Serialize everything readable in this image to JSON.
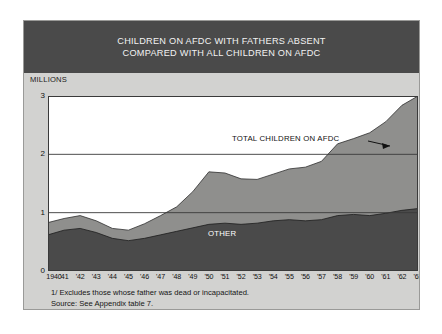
{
  "figure": {
    "title_lines": [
      "CHILDREN ON AFDC WITH FATHERS ABSENT",
      "COMPARED WITH ALL CHILDREN ON AFDC"
    ],
    "units_label": "MILLIONS",
    "footnotes": [
      "1/ Excludes those whose father was dead or incapacitated.",
      "Source: See Appendix table 7."
    ],
    "colors": {
      "title_band": "#4a4a4a",
      "panel": "#d2d2d0",
      "plot_background": "#ffffff",
      "band_total": "#8f8f8d",
      "band_other": "#4a4a4a",
      "gridline": "#3a3a3a"
    }
  },
  "chart_data": {
    "type": "area",
    "title": "CHILDREN ON AFDC WITH FATHERS ABSENT COMPARED WITH ALL CHILDREN ON AFDC",
    "xlabel": "",
    "ylabel": "MILLIONS",
    "ylim": [
      0,
      3
    ],
    "yticks": [
      0,
      1,
      2,
      3
    ],
    "ytick_labels": [
      "0",
      "1",
      "2",
      "3"
    ],
    "grid": true,
    "gridlines_at": [
      1,
      2,
      3
    ],
    "legend_position": "inline-annotations",
    "stacked": true,
    "x": [
      1940,
      1941,
      1942,
      1943,
      1944,
      1945,
      1946,
      1947,
      1948,
      1949,
      1950,
      1951,
      1952,
      1953,
      1954,
      1955,
      1956,
      1957,
      1958,
      1959,
      1960,
      1961,
      1962,
      1963
    ],
    "xtick_labels": [
      "1940",
      "'41",
      "'42",
      "'43",
      "'44",
      "'45",
      "'46",
      "'47",
      "'48",
      "'49",
      "'50",
      "'51",
      "'52",
      "'53",
      "'54",
      "'55",
      "'56",
      "'57",
      "'58",
      "'59",
      "'60",
      "'61",
      "'62",
      "'63"
    ],
    "series": [
      {
        "name": "OTHER",
        "annotation": "OTHER",
        "color": "#4a4a4a",
        "values": [
          0.62,
          0.7,
          0.73,
          0.66,
          0.56,
          0.52,
          0.56,
          0.62,
          0.68,
          0.74,
          0.8,
          0.82,
          0.8,
          0.82,
          0.86,
          0.88,
          0.86,
          0.88,
          0.95,
          0.97,
          0.95,
          0.99,
          1.04,
          1.07
        ]
      },
      {
        "name": "CHILDREN ON AFDC WITH FATHERS ABSENT",
        "annotation": "TOTAL CHILDREN ON AFDC",
        "color": "#8f8f8d",
        "values": [
          0.21,
          0.2,
          0.22,
          0.2,
          0.17,
          0.18,
          0.25,
          0.33,
          0.42,
          0.62,
          0.9,
          0.86,
          0.78,
          0.75,
          0.8,
          0.87,
          0.92,
          1.0,
          1.23,
          1.3,
          1.42,
          1.57,
          1.8,
          1.93
        ]
      }
    ],
    "total_series": {
      "name": "TOTAL CHILDREN ON AFDC",
      "values": [
        0.83,
        0.9,
        0.95,
        0.86,
        0.73,
        0.7,
        0.81,
        0.95,
        1.1,
        1.36,
        1.7,
        1.68,
        1.58,
        1.57,
        1.66,
        1.75,
        1.78,
        1.88,
        2.18,
        2.27,
        2.37,
        2.56,
        2.84,
        3.0
      ]
    },
    "annotations": [
      {
        "text": "TOTAL CHILDREN ON AFDC",
        "kind": "label-with-arrow",
        "points_to": "upper-band"
      },
      {
        "text": "OTHER",
        "kind": "label",
        "points_to": "lower-band"
      }
    ]
  }
}
